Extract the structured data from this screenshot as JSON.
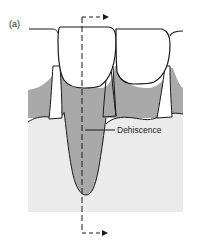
{
  "figure": {
    "panel_label": "(a)",
    "annotations": [
      {
        "id": "dehiscence",
        "text": "Dehiscence"
      }
    ],
    "structures": {
      "crowns": "white",
      "roots_and_gingiva": "mid-gray",
      "alveolar_bone": "light-gray"
    },
    "section_line": {
      "style": "dashed",
      "direction_arrows": [
        "right",
        "right"
      ]
    },
    "colors": {
      "outline": "#1a1a1a",
      "root_gray": "#a9a9a9",
      "bone_gray": "#ebebeb",
      "background": "#ffffff"
    }
  }
}
